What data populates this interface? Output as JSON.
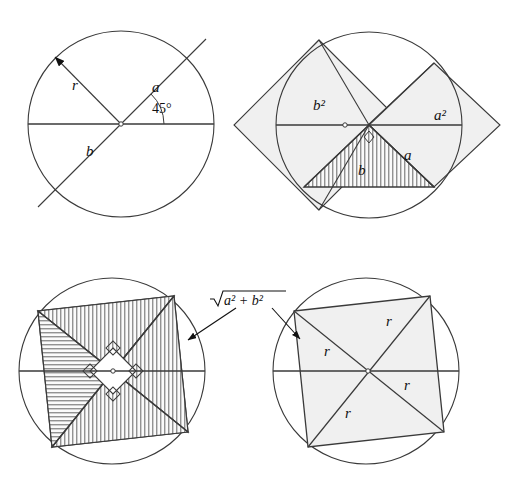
{
  "figure": {
    "background_color": "#ffffff",
    "stroke_color": "#3a3a3a",
    "fill_color": "#f0f0f0",
    "hatch_color": "#555555",
    "width": 518,
    "height": 488
  },
  "panels": [
    {
      "id": "panel-top-left",
      "name": "chord-at-45-degrees",
      "circle": {
        "cx": 121,
        "cy": 124,
        "r": 93
      },
      "labels": [
        {
          "name": "label-r",
          "text": "r",
          "x": 72,
          "y": 90,
          "style": "italic"
        },
        {
          "name": "label-a",
          "text": "a",
          "x": 152,
          "y": 92,
          "style": "italic"
        },
        {
          "name": "label-b",
          "text": "b",
          "x": 86,
          "y": 156,
          "style": "italic"
        },
        {
          "name": "label-angle",
          "text": "45°",
          "x": 152,
          "y": 113,
          "style": "upright"
        }
      ],
      "angle_degrees": 45
    },
    {
      "id": "panel-top-right",
      "name": "squares-a2-b2-on-legs",
      "circle": {
        "cx": 369,
        "cy": 125,
        "r": 93
      },
      "labels": [
        {
          "name": "label-b-squared",
          "text": "b²",
          "x": 313,
          "y": 110,
          "style": "italic"
        },
        {
          "name": "label-a-squared",
          "text": "a²",
          "x": 434,
          "y": 120,
          "style": "italic"
        },
        {
          "name": "label-b",
          "text": "b",
          "x": 358,
          "y": 175,
          "style": "italic"
        },
        {
          "name": "label-a",
          "text": "a",
          "x": 404,
          "y": 160,
          "style": "italic"
        }
      ]
    },
    {
      "id": "panel-bottom-left",
      "name": "inscribed-square-hatched-quadrants",
      "circle": {
        "cx": 112,
        "cy": 371,
        "r": 93
      },
      "labels": []
    },
    {
      "id": "panel-bottom-right",
      "name": "inscribed-square-with-radii",
      "circle": {
        "cx": 366,
        "cy": 371,
        "r": 93
      },
      "labels": [
        {
          "name": "label-r-top",
          "text": "r",
          "x": 386,
          "y": 326,
          "style": "italic"
        },
        {
          "name": "label-r-left",
          "text": "r",
          "x": 324,
          "y": 356,
          "style": "italic"
        },
        {
          "name": "label-r-right",
          "text": "r",
          "x": 404,
          "y": 390,
          "style": "italic"
        },
        {
          "name": "label-r-bottom",
          "text": "r",
          "x": 345,
          "y": 418,
          "style": "italic"
        }
      ]
    }
  ],
  "annotation": {
    "name": "hypotenuse-label",
    "text_radicand": "a² + b²",
    "text_full": "√(a² + b²)",
    "x": 253,
    "y": 300,
    "arrows": [
      {
        "name": "arrow-to-bottom-left",
        "x1": 236,
        "y1": 307,
        "x2": 186,
        "y2": 339
      },
      {
        "name": "arrow-to-bottom-right",
        "x1": 272,
        "y1": 307,
        "x2": 300,
        "y2": 338
      }
    ]
  }
}
